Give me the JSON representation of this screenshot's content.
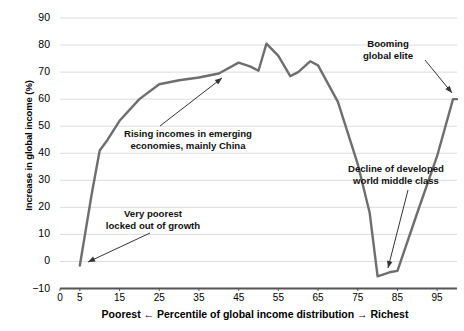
{
  "chart_data": {
    "type": "line",
    "title": "",
    "subtitle": "",
    "xlabel": "Poorest ← Percentile of global income distribution → Richest",
    "ylabel": "Increase in global income (%)",
    "xlim": [
      0,
      100
    ],
    "ylim": [
      -10,
      90
    ],
    "grid": true,
    "legend_position": "none",
    "xticks": [
      "0",
      "5",
      "15",
      "25",
      "35",
      "45",
      "55",
      "65",
      "75",
      "85",
      "95"
    ],
    "xtick_values": [
      0,
      5,
      15,
      25,
      35,
      45,
      55,
      65,
      75,
      85,
      95
    ],
    "yticks": [
      "90",
      "80",
      "70",
      "60",
      "50",
      "40",
      "30",
      "20",
      "10",
      "0",
      "−10"
    ],
    "ytick_values": [
      90,
      80,
      70,
      60,
      50,
      40,
      30,
      20,
      10,
      0,
      -10
    ],
    "series": [
      {
        "name": "Increase in global income",
        "color": "#6e6e6e",
        "x": [
          5,
          8,
          10,
          12,
          15,
          20,
          25,
          30,
          35,
          40,
          45,
          48,
          50,
          52,
          55,
          58,
          60,
          63,
          65,
          70,
          75,
          78,
          80,
          83,
          85,
          90,
          95,
          99,
          100
        ],
        "values": [
          -1.5,
          25,
          41,
          45,
          52,
          60,
          65.5,
          67,
          68,
          69.5,
          73.5,
          72,
          70.5,
          80.5,
          76,
          68.5,
          70,
          74,
          72.5,
          59,
          36,
          18,
          -5.5,
          -4,
          -3.5,
          18,
          39,
          60,
          60
        ]
      }
    ],
    "annotations": [
      {
        "id": "very-poorest",
        "lines": [
          "Very poorest",
          "locked out of growth"
        ],
        "target_x": 5,
        "target_y": -1.5
      },
      {
        "id": "rising-incomes",
        "lines": [
          "Rising incomes in emerging",
          "economies, mainly China"
        ],
        "target_x": 45,
        "target_y": 72
      },
      {
        "id": "decline-middle-class",
        "lines": [
          "Decline of developed",
          "world middle class"
        ],
        "target_x": 81,
        "target_y": -3.5
      },
      {
        "id": "booming-global-elite",
        "lines": [
          "Booming",
          "global elite"
        ],
        "target_x": 99,
        "target_y": 60
      }
    ]
  },
  "axes": {
    "y_axis_label": "Increase in global income (%)",
    "x_axis_label": "Poorest ← Percentile of global income distribution → Richest",
    "ytick_labels": [
      "90",
      "80",
      "70",
      "60",
      "50",
      "40",
      "30",
      "20",
      "10",
      "0",
      "−10"
    ],
    "xtick_labels": [
      "0",
      "5",
      "15",
      "25",
      "35",
      "45",
      "55",
      "65",
      "75",
      "85",
      "95"
    ]
  },
  "annotation_text": {
    "very_poorest_l1": "Very poorest",
    "very_poorest_l2": "locked out of growth",
    "rising_incomes_l1": "Rising incomes in emerging",
    "rising_incomes_l2": "economies, mainly China",
    "decline_l1": "Decline of developed",
    "decline_l2": "world middle class",
    "booming_l1": "Booming",
    "booming_l2": "global elite"
  },
  "style": {
    "line_color": "#6e6e6e",
    "grid_color": "#dcdcdc",
    "axis_color": "#555555",
    "text_color": "#000000",
    "background": "#ffffff"
  }
}
